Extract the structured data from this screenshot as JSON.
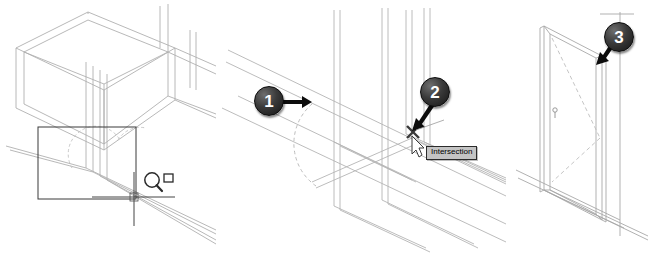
{
  "figure": {
    "cutoff_text": "",
    "line_color": "#aeaeae",
    "accent_color": "#1a1a1a",
    "panels": [
      {
        "id": "left",
        "name": "zoom-window-selection-view",
        "description": "Isometric wireframe of a wall box with a zoom window rectangle and zoom-window cursor icon"
      },
      {
        "id": "middle",
        "name": "intersection-snap-view",
        "description": "Zoomed isometric wall corner with door swing arc and intersection object snap"
      },
      {
        "id": "right",
        "name": "placed-door-view",
        "description": "Isometric view of the finished door in the wall opening"
      }
    ]
  },
  "callouts": [
    {
      "id": "1",
      "label": "1",
      "panel": "middle",
      "arrow": "right"
    },
    {
      "id": "2",
      "label": "2",
      "panel": "middle",
      "arrow": "down-left"
    },
    {
      "id": "3",
      "label": "3",
      "panel": "right",
      "arrow": "down-left"
    }
  ],
  "tooltip": {
    "name": "osnap-tooltip",
    "text": "Intersection",
    "background": "#c4c4c4",
    "border": "#2b2b2b",
    "text_color": "#000000"
  },
  "icons": {
    "zoom_window": "magnifier-window-icon",
    "crosshair": "crosshair-cursor-icon",
    "pointer": "arrow-pointer-icon",
    "snap_marker": "intersection-snap-marker-icon"
  }
}
